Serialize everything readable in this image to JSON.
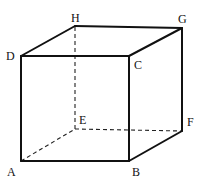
{
  "diagram": {
    "type": "cube",
    "colors": {
      "stroke": "#111111",
      "background": "#ffffff"
    },
    "vertices": {
      "A": {
        "label": "A",
        "x": 21,
        "y": 161
      },
      "B": {
        "label": "B",
        "x": 129,
        "y": 161
      },
      "C": {
        "label": "C",
        "x": 129,
        "y": 56
      },
      "D": {
        "label": "D",
        "x": 21,
        "y": 56
      },
      "E": {
        "label": "E",
        "x": 75,
        "y": 129
      },
      "F": {
        "label": "F",
        "x": 182,
        "y": 131
      },
      "G": {
        "label": "G",
        "x": 182,
        "y": 28
      },
      "H": {
        "label": "H",
        "x": 75,
        "y": 26
      }
    },
    "visible_edges": [
      "AB",
      "BC",
      "CD",
      "DA",
      "DH",
      "HG",
      "GC",
      "GF",
      "FB"
    ],
    "hidden_edges": [
      "AE",
      "EF",
      "EH"
    ]
  }
}
